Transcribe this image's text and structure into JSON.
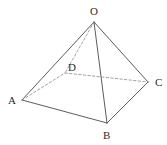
{
  "figure": {
    "kind": "geometry-solid-diagram",
    "canvas": {
      "width": 167,
      "height": 145
    },
    "colors": {
      "background": "#ffffff",
      "stroke": "#4a4a4a",
      "hidden_stroke": "#8a8a8a",
      "label": "#2b2b2b"
    },
    "stroke_width": 0.9,
    "hidden_stroke_width": 0.8,
    "dash_pattern": "2.4 2.2",
    "vertices": [
      {
        "id": "O",
        "label": "O",
        "x": 94,
        "y": 22,
        "label_x": 90,
        "label_y": 6,
        "hidden": false
      },
      {
        "id": "A",
        "label": "A",
        "x": 22,
        "y": 100,
        "label_x": 8,
        "label_y": 95,
        "hidden": false
      },
      {
        "id": "B",
        "label": "B",
        "x": 107,
        "y": 123,
        "label_x": 103,
        "label_y": 130,
        "hidden": false
      },
      {
        "id": "C",
        "label": "C",
        "x": 148,
        "y": 82,
        "label_x": 155,
        "label_y": 77,
        "hidden": false
      },
      {
        "id": "D",
        "label": "D",
        "x": 65,
        "y": 73,
        "label_x": 68,
        "label_y": 62,
        "hidden": true
      }
    ],
    "edges": [
      {
        "id": "OA",
        "from": "O",
        "to": "A",
        "hidden": false
      },
      {
        "id": "OB",
        "from": "O",
        "to": "B",
        "hidden": false
      },
      {
        "id": "OC",
        "from": "O",
        "to": "C",
        "hidden": false
      },
      {
        "id": "OD",
        "from": "O",
        "to": "D",
        "hidden": true
      },
      {
        "id": "AB",
        "from": "A",
        "to": "B",
        "hidden": false
      },
      {
        "id": "BC",
        "from": "B",
        "to": "C",
        "hidden": false
      },
      {
        "id": "AD",
        "from": "A",
        "to": "D",
        "hidden": true
      },
      {
        "id": "DC",
        "from": "D",
        "to": "C",
        "hidden": true
      }
    ]
  }
}
